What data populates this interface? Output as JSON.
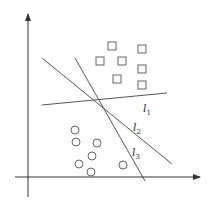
{
  "diagram": {
    "type": "linear-separability illustration",
    "axes": {
      "x_axis": {
        "x1": 15,
        "y1": 177,
        "x2": 200,
        "y2": 177
      },
      "y_axis": {
        "x1": 28,
        "y1": 197,
        "x2": 28,
        "y2": 14
      }
    },
    "lines": [
      {
        "name": "l1",
        "label": "l",
        "subscript": "1",
        "x1": 42,
        "y1": 105,
        "x2": 167,
        "y2": 93,
        "label_x": 143,
        "label_y": 112
      },
      {
        "name": "l2",
        "label": "l",
        "subscript": "2",
        "x1": 42,
        "y1": 58,
        "x2": 172,
        "y2": 164,
        "label_x": 133,
        "label_y": 131
      },
      {
        "name": "l3",
        "label": "l",
        "subscript": "3",
        "x1": 75,
        "y1": 58,
        "x2": 145,
        "y2": 181,
        "label_x": 132,
        "label_y": 156
      }
    ],
    "squares": [
      {
        "cx": 112,
        "cy": 46
      },
      {
        "cx": 142,
        "cy": 49
      },
      {
        "cx": 100,
        "cy": 61
      },
      {
        "cx": 122,
        "cy": 61
      },
      {
        "cx": 142,
        "cy": 69
      },
      {
        "cx": 117,
        "cy": 79
      },
      {
        "cx": 142,
        "cy": 85
      }
    ],
    "circles": [
      {
        "cx": 75,
        "cy": 130
      },
      {
        "cx": 76,
        "cy": 142
      },
      {
        "cx": 97,
        "cy": 143
      },
      {
        "cx": 92,
        "cy": 156
      },
      {
        "cx": 79,
        "cy": 164
      },
      {
        "cx": 123,
        "cy": 165
      },
      {
        "cx": 91,
        "cy": 172
      }
    ],
    "colors": {
      "stroke": "#555555",
      "axis": "#333333",
      "background": "#ffffff"
    }
  }
}
